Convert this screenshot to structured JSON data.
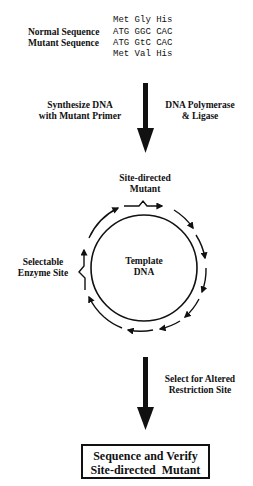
{
  "sequences": {
    "top_aa": "Met Gly His",
    "normal_label": "Normal Sequence",
    "normal_seq": "ATG GGC CAC",
    "mutant_label": "Mutant Sequence",
    "mutant_seq": "ATG GtC CAC",
    "bottom_aa": "Met Val His"
  },
  "step1": {
    "left_line1": "Synthesize DNA",
    "left_line2": "with Mutant Primer",
    "right_line1": "DNA Polymerase",
    "right_line2": "& Ligase"
  },
  "plasmid": {
    "mutant_line1": "Site-directed",
    "mutant_line2": "Mutant",
    "enzyme_line1": "Selectable",
    "enzyme_line2": "Enzyme Site",
    "center_line1": "Template",
    "center_line2": "DNA"
  },
  "step2": {
    "line1": "Select for Altered",
    "line2": "Restriction Site"
  },
  "result_box": {
    "line1": "Sequence and Verify",
    "line2": "Site-directed  Mutant"
  }
}
